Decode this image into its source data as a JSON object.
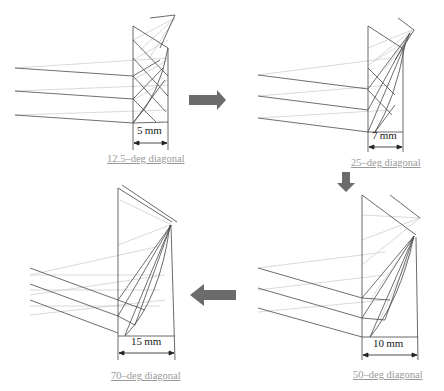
{
  "figure": {
    "panels": [
      {
        "id": "p1",
        "caption": "12.5–deg diagonal",
        "dimension": "5 mm",
        "angle_deg": 12.5,
        "thickness_mm": 5
      },
      {
        "id": "p2",
        "caption": "25–deg diagonal",
        "dimension": "7 mm",
        "angle_deg": 25,
        "thickness_mm": 7
      },
      {
        "id": "p3",
        "caption": "50–deg diagonal",
        "dimension": "10 mm",
        "angle_deg": 50,
        "thickness_mm": 10
      },
      {
        "id": "p4",
        "caption": "70–deg diagonal",
        "dimension": "15 mm",
        "angle_deg": 70,
        "thickness_mm": 15
      }
    ],
    "arrows": [
      {
        "from": "p1",
        "to": "p2",
        "direction": "right"
      },
      {
        "from": "p2",
        "to": "p3",
        "direction": "down"
      },
      {
        "from": "p3",
        "to": "p4",
        "direction": "left"
      }
    ],
    "colors": {
      "arrow": "#6b6b6b",
      "line_dark": "#555555",
      "line_light": "#c8c8c8",
      "caption": "#9a9a9a"
    }
  }
}
